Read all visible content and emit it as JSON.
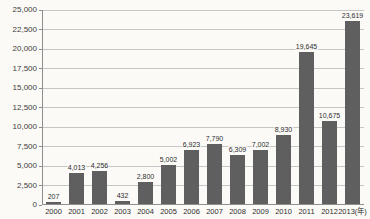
{
  "chart_data": {
    "type": "bar",
    "title": "",
    "xlabel": "",
    "ylabel": "",
    "x_unit_suffix": "(年)",
    "categories": [
      "2000",
      "2001",
      "2002",
      "2003",
      "2004",
      "2005",
      "2006",
      "2007",
      "2008",
      "2009",
      "2010",
      "2011",
      "2012",
      "2013"
    ],
    "values": [
      207,
      4013,
      4256,
      432,
      2800,
      5002,
      6923,
      7790,
      6309,
      7002,
      8930,
      19645,
      10675,
      23619
    ],
    "value_labels": [
      "207",
      "4,013",
      "4,256",
      "432",
      "2,800",
      "5,002",
      "6,923",
      "7,790",
      "6,309",
      "7,002",
      "8,930",
      "19,645",
      "10,675",
      "23,619"
    ],
    "y_ticks": [
      0,
      2500,
      5000,
      7500,
      10000,
      12500,
      15000,
      17500,
      20000,
      22500,
      25000
    ],
    "y_tick_labels": [
      "0",
      "2,500",
      "5,000",
      "7,500",
      "10,000",
      "12,500",
      "15,000",
      "17,500",
      "20,000",
      "22,500",
      "25,000"
    ],
    "ylim": [
      0,
      25000
    ],
    "grid": "horizontal",
    "legend": "none",
    "colors": {
      "bar": "#5f5f5f",
      "gridline": "#c6c6c6",
      "axis": "#8f8f8f",
      "text": "#2e2e2e",
      "background": "#fbfaf7"
    }
  }
}
